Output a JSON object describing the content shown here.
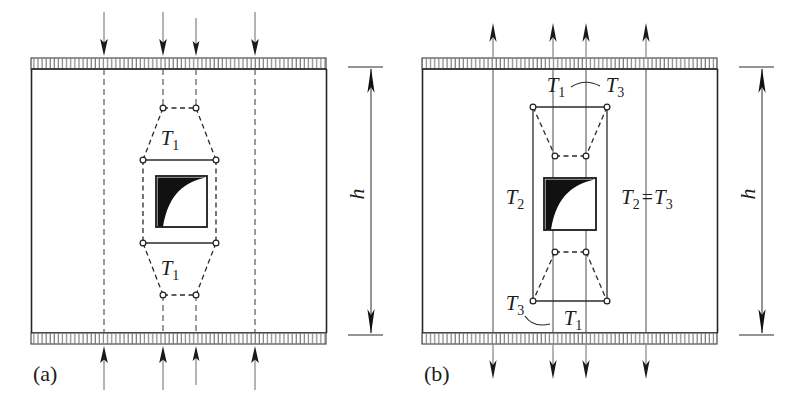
{
  "figure": {
    "type": "strut-and-tie diagram of a plate with a central square opening",
    "background_color": "#ffffff",
    "ink_color": "#1a1a1a",
    "width": 809,
    "height": 402
  },
  "panels": [
    {
      "id": "a",
      "caption": "(a)",
      "loading": "compression",
      "top_arrow_direction": "down",
      "bottom_arrow_direction": "up",
      "truss_shape": "hexagonal bottle-shaped strut field",
      "dimension_label": "h",
      "tie_labels": [
        {
          "text": "T",
          "subscript": "1",
          "position": "above-opening"
        },
        {
          "text": "T",
          "subscript": "1",
          "position": "below-opening"
        }
      ],
      "load_arrow_count_top": 4,
      "load_arrow_count_bottom": 4,
      "edge_bearing": "hatched band top and bottom"
    },
    {
      "id": "b",
      "caption": "(b)",
      "loading": "tension",
      "top_arrow_direction": "up",
      "bottom_arrow_direction": "down",
      "truss_shape": "rectangular frame with inverted trapezoid strut fans",
      "dimension_label": "h",
      "tie_labels": [
        {
          "text": "T",
          "subscript": "1",
          "position": "top-inner"
        },
        {
          "text": "T",
          "subscript": "3",
          "position": "top-outer"
        },
        {
          "text": "T",
          "subscript": "2",
          "position": "mid-left"
        },
        {
          "text": "T",
          "subscript": "2",
          "subscript2": "3",
          "relation": "=",
          "position": "mid-right",
          "full": "T2 = T3"
        },
        {
          "text": "T",
          "subscript": "3",
          "position": "bottom-outer"
        },
        {
          "text": "T",
          "subscript": "1",
          "position": "bottom-inner"
        }
      ],
      "load_arrow_count_top": 4,
      "load_arrow_count_bottom": 4,
      "edge_bearing": "hatched band top and bottom"
    }
  ],
  "labels": {
    "panel_a": "(a)",
    "panel_b": "(b)",
    "height_symbol": "h",
    "T": "T",
    "sub1": "1",
    "sub2": "2",
    "sub3": "3",
    "equals": "="
  },
  "colors": {
    "ink": "#1a1a1a",
    "light_line": "#4a4a4a",
    "hatch": "#555555",
    "fill_wedge": "#111111",
    "paper": "#ffffff"
  }
}
